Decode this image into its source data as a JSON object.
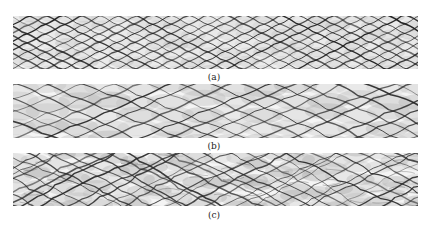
{
  "figure": {
    "panels": [
      {
        "id": "a",
        "label": "(a)",
        "description": "Regular cellular pattern (fine, uniform diamond cells)",
        "cell_width": 36,
        "cell_height": 18,
        "jitter": 1.5,
        "stroke": "#1a1a1a",
        "shade": "#bdbdbd"
      },
      {
        "id": "b",
        "label": "(b)",
        "description": "Moderately irregular cellular pattern (larger cells)",
        "cell_width": 62,
        "cell_height": 27,
        "jitter": 6,
        "stroke": "#222222",
        "shade": "#b0b0b0"
      },
      {
        "id": "c",
        "label": "(c)",
        "description": "Highly irregular cellular pattern with substructure",
        "cell_width": 40,
        "cell_height": 20,
        "jitter": 9,
        "stroke": "#2a2a2a",
        "shade": "#a8a8a8"
      }
    ]
  }
}
